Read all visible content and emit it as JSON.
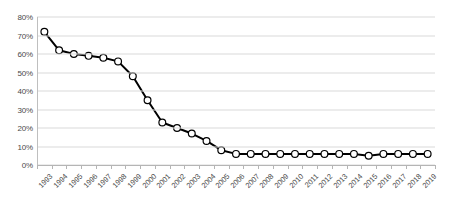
{
  "chart_data": {
    "type": "line",
    "title": "",
    "subtitle": "",
    "xlabel": "",
    "ylabel": "",
    "grid": true,
    "legend": "none",
    "xlim": [
      1993,
      2019
    ],
    "ylim": [
      0,
      80
    ],
    "ytick_labels": [
      "80%",
      "70%",
      "60%",
      "50%",
      "40%",
      "30%",
      "20%",
      "10%",
      "0%"
    ],
    "ytick_values": [
      80,
      70,
      60,
      50,
      40,
      30,
      20,
      10,
      0
    ],
    "categories": [
      "1993",
      "1994",
      "1995",
      "1996",
      "1997",
      "1998",
      "1999",
      "2000",
      "2001",
      "2002",
      "2003",
      "2004",
      "2005",
      "2006",
      "2007",
      "2008",
      "2009",
      "2010",
      "2011",
      "2012",
      "2013",
      "2014",
      "2015",
      "2016",
      "2017",
      "2018",
      "2019"
    ],
    "series": [
      {
        "name": "",
        "marker": "circle-open",
        "line_color": "#000000",
        "marker_fill": "#ffffff",
        "marker_edge": "#000000",
        "values": [
          72,
          62,
          60,
          59,
          58,
          56,
          48,
          35,
          23,
          20,
          17,
          13,
          8,
          6,
          6,
          6,
          6,
          6,
          6,
          6,
          6,
          6,
          5,
          6,
          6,
          6,
          6
        ]
      }
    ]
  }
}
